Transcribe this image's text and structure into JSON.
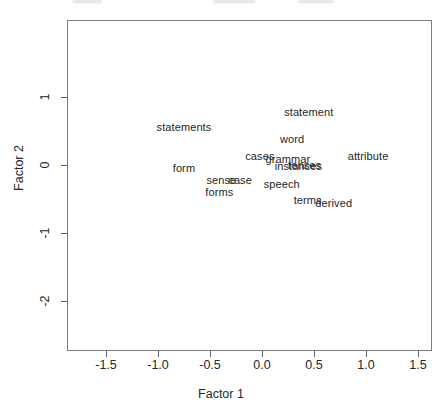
{
  "figure": {
    "xlabel": "Factor 1",
    "ylabel": "Factor 2",
    "background_color": "#ffffff",
    "frame_color": "#7d7d7d",
    "text_color": "#262626",
    "top_edge_artifact": "illegible cropped text remnant at top edge"
  },
  "chart_data": {
    "type": "scatter",
    "title": "",
    "xlabel": "Factor 1",
    "ylabel": "Factor 2",
    "marker": "text-labels-only",
    "grid": false,
    "legend": false,
    "xlim": [
      -1.87,
      1.63
    ],
    "ylim": [
      -2.72,
      2.15
    ],
    "x_ticks": [
      "-1.5",
      "-1.0",
      "-0.5",
      "0.0",
      "0.5",
      "1.0",
      "1.5"
    ],
    "y_ticks": [
      "1",
      "0",
      "-1",
      "-2"
    ],
    "points": [
      {
        "label": "statements",
        "x": -0.76,
        "y": 0.57
      },
      {
        "label": "statement",
        "x": 0.44,
        "y": 0.79
      },
      {
        "label": "word",
        "x": 0.28,
        "y": 0.4
      },
      {
        "label": "attribute",
        "x": 1.01,
        "y": 0.15
      },
      {
        "label": "cases",
        "x": -0.03,
        "y": 0.15
      },
      {
        "label": "grammar",
        "x": 0.24,
        "y": 0.1
      },
      {
        "label": "instances",
        "x": 0.34,
        "y": 0.0
      },
      {
        "label": "tenses",
        "x": 0.4,
        "y": 0.01
      },
      {
        "label": "speech",
        "x": 0.18,
        "y": -0.26
      },
      {
        "label": "form",
        "x": -0.76,
        "y": -0.03
      },
      {
        "label": "sense",
        "x": -0.4,
        "y": -0.21
      },
      {
        "label": "case",
        "x": -0.22,
        "y": -0.21
      },
      {
        "label": "forms",
        "x": -0.42,
        "y": -0.38
      },
      {
        "label": "terms",
        "x": 0.43,
        "y": -0.5
      },
      {
        "label": "derived",
        "x": 0.68,
        "y": -0.54
      }
    ]
  }
}
